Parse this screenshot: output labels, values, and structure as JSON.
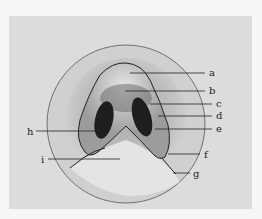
{
  "figure": {
    "labels": [
      {
        "id": "a",
        "text": "a",
        "x": 213,
        "y": 76,
        "lx1": 130,
        "ly1": 73,
        "lx2": 205,
        "ly2": 73
      },
      {
        "id": "b",
        "text": "b",
        "x": 213,
        "y": 94,
        "lx1": 125,
        "ly1": 91,
        "lx2": 205,
        "ly2": 91
      },
      {
        "id": "c",
        "text": "c",
        "x": 220,
        "y": 107,
        "lx1": 150,
        "ly1": 104,
        "lx2": 212,
        "ly2": 104
      },
      {
        "id": "d",
        "text": "d",
        "x": 220,
        "y": 120,
        "lx1": 158,
        "ly1": 116,
        "lx2": 212,
        "ly2": 116
      },
      {
        "id": "e",
        "text": "e",
        "x": 220,
        "y": 133,
        "lx1": 155,
        "ly1": 130,
        "lx2": 212,
        "ly2": 130
      },
      {
        "id": "f",
        "text": "f",
        "x": 205,
        "y": 158,
        "lx1": 170,
        "ly1": 155,
        "lx2": 198,
        "ly2": 155
      },
      {
        "id": "g",
        "text": "g",
        "x": 194,
        "y": 177,
        "lx1": 173,
        "ly1": 173,
        "lx2": 187,
        "ly2": 173
      },
      {
        "id": "h",
        "text": "h",
        "x": 28,
        "y": 134,
        "lx1": 37,
        "ly1": 131,
        "lx2": 100,
        "ly2": 131
      },
      {
        "id": "i",
        "text": "i",
        "x": 42,
        "y": 163,
        "lx1": 48,
        "ly1": 160,
        "lx2": 120,
        "ly2": 160
      }
    ],
    "colors": {
      "background": "#f6f6f6",
      "panel": "#dcdcdc",
      "ink": "#222222",
      "nostril": "#1e1e1e"
    }
  }
}
